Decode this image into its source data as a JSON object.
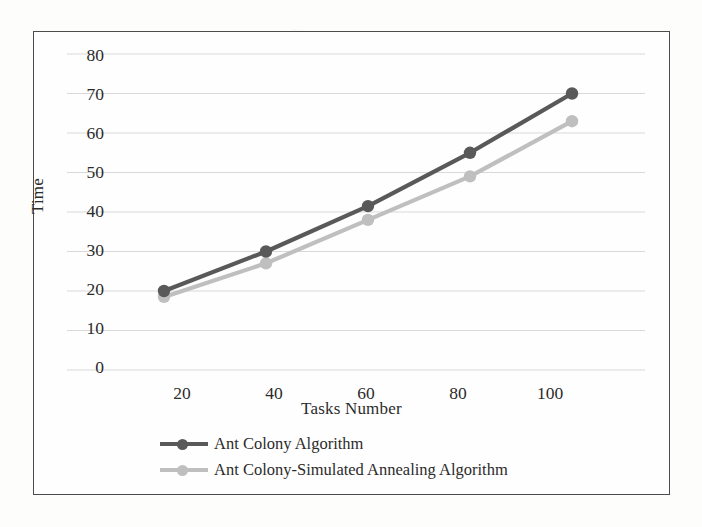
{
  "chart_data": {
    "type": "line",
    "title": "",
    "xlabel": "Tasks Number",
    "ylabel": "Time",
    "x": [
      20,
      40,
      60,
      80,
      100
    ],
    "xticklabels": [
      "20",
      "40",
      "60",
      "80",
      "100"
    ],
    "yticklabels": [
      "0",
      "10",
      "20",
      "30",
      "40",
      "50",
      "60",
      "70",
      "80"
    ],
    "yticks": [
      0,
      10,
      20,
      30,
      40,
      50,
      60,
      70,
      80
    ],
    "xlim": [
      10,
      110
    ],
    "ylim": [
      0,
      80
    ],
    "grid": "horizontal",
    "legend_position": "bottom",
    "series": [
      {
        "name": "Ant Colony Algorithm",
        "color": "#595959",
        "marker": "circle",
        "values": [
          20,
          30,
          41.5,
          55,
          70
        ]
      },
      {
        "name": "Ant Colony-Simulated Annealing Algorithm",
        "color": "#bfbfbf",
        "marker": "circle",
        "values": [
          18.5,
          27,
          38,
          49,
          63
        ]
      }
    ]
  },
  "colors": {
    "series_dark": "#595959",
    "series_light": "#bfbfbf",
    "frame": "#4c4c4c",
    "gridline": "#d9d9d9",
    "text": "#2b2b2b",
    "background": "#fefefe"
  }
}
